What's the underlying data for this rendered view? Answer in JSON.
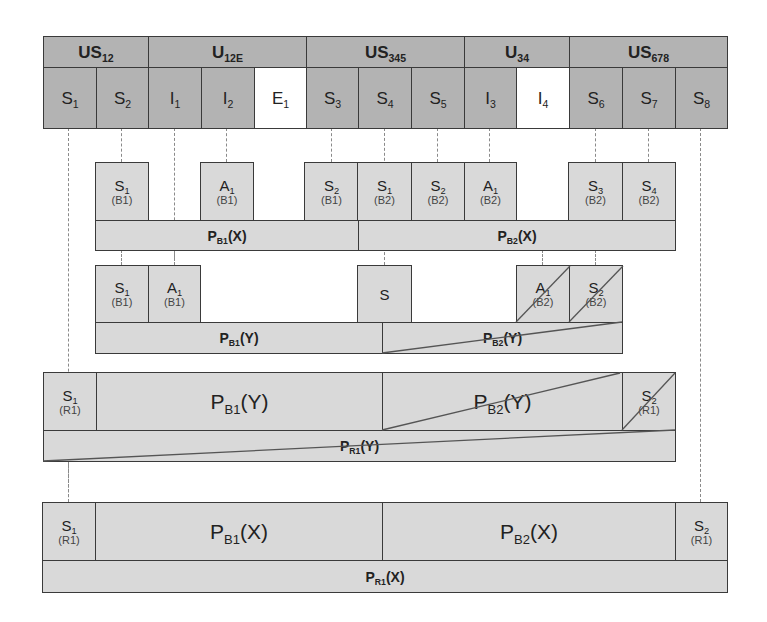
{
  "header_groups": [
    {
      "base": "US",
      "sub": "12"
    },
    {
      "base": "U",
      "sub": "12E"
    },
    {
      "base": "US",
      "sub": "345"
    },
    {
      "base": "U",
      "sub": "34"
    },
    {
      "base": "US",
      "sub": "678"
    }
  ],
  "top_cells": [
    {
      "base": "S",
      "sub": "1",
      "fill": "dark"
    },
    {
      "base": "S",
      "sub": "2",
      "fill": "dark"
    },
    {
      "base": "I",
      "sub": "1",
      "fill": "dark"
    },
    {
      "base": "I",
      "sub": "2",
      "fill": "dark"
    },
    {
      "base": "E",
      "sub": "1",
      "fill": "white"
    },
    {
      "base": "S",
      "sub": "3",
      "fill": "dark"
    },
    {
      "base": "S",
      "sub": "4",
      "fill": "dark"
    },
    {
      "base": "S",
      "sub": "5",
      "fill": "dark"
    },
    {
      "base": "I",
      "sub": "3",
      "fill": "dark"
    },
    {
      "base": "I",
      "sub": "4",
      "fill": "white"
    },
    {
      "base": "S",
      "sub": "6",
      "fill": "dark"
    },
    {
      "base": "S",
      "sub": "7",
      "fill": "dark"
    },
    {
      "base": "S",
      "sub": "8",
      "fill": "dark"
    }
  ],
  "row_x": {
    "boxes": [
      {
        "base": "S",
        "sub": "1",
        "tag": "(B1)"
      },
      {
        "base": "A",
        "sub": "1",
        "tag": "(B1)"
      },
      {
        "base": "S",
        "sub": "2",
        "tag": "(B1)"
      },
      {
        "base": "S",
        "sub": "1",
        "tag": "(B2)"
      },
      {
        "base": "S",
        "sub": "2",
        "tag": "(B2)"
      },
      {
        "base": "A",
        "sub": "1",
        "tag": "(B2)"
      },
      {
        "base": "S",
        "sub": "3",
        "tag": "(B2)"
      },
      {
        "base": "S",
        "sub": "4",
        "tag": "(B2)"
      }
    ],
    "bars": [
      {
        "base": "P",
        "sub": "B1",
        "arg": "(X)"
      },
      {
        "base": "P",
        "sub": "B2",
        "arg": "(X)"
      }
    ]
  },
  "row_y": {
    "boxes": [
      {
        "base": "S",
        "sub": "1",
        "tag": "(B1)"
      },
      {
        "base": "A",
        "sub": "1",
        "tag": "(B1)"
      },
      {
        "base": "S",
        "sub": "",
        "tag": ""
      },
      {
        "base": "A",
        "sub": "1",
        "tag": "(B2)"
      },
      {
        "base": "S",
        "sub": "2",
        "tag": "(B2)"
      }
    ],
    "bars": [
      {
        "base": "P",
        "sub": "B1",
        "arg": "(Y)"
      },
      {
        "base": "P",
        "sub": "B2",
        "arg": "(Y)"
      }
    ]
  },
  "row_ry": {
    "cells": [
      {
        "base": "S",
        "sub": "1",
        "tag": "(R1)"
      },
      {
        "base": "P",
        "sub": "B1",
        "arg": "(Y)"
      },
      {
        "base": "P",
        "sub": "B2",
        "arg": "(Y)"
      },
      {
        "base": "S",
        "sub": "2",
        "tag": "(R1)"
      }
    ],
    "bar": {
      "base": "P",
      "sub": "R1",
      "arg": "(Y)"
    }
  },
  "row_rx": {
    "cells": [
      {
        "base": "S",
        "sub": "1",
        "tag": "(R1)"
      },
      {
        "base": "P",
        "sub": "B1",
        "arg": "(X)"
      },
      {
        "base": "P",
        "sub": "B2",
        "arg": "(X)"
      },
      {
        "base": "S",
        "sub": "2",
        "tag": "(R1)"
      }
    ],
    "bar": {
      "base": "P",
      "sub": "R1",
      "arg": "(X)"
    }
  }
}
